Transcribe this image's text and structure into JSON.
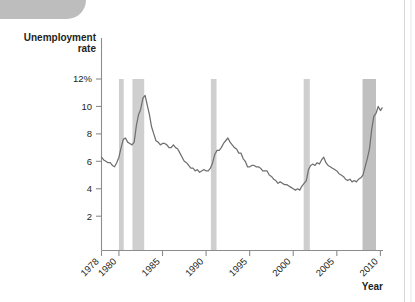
{
  "figure": {
    "y_axis_title_line1": "Unemployment",
    "y_axis_title_line2": "rate",
    "x_axis_title": "Year",
    "line_color": "#6f6f6f",
    "recession_band_color": "#cfcfcf",
    "recession_band_color_dark": "#c0c0c0",
    "axis_color": "#8c8c8c"
  },
  "chart_data": {
    "type": "line",
    "title": "",
    "xlabel": "Year",
    "ylabel": "Unemployment rate",
    "xlim": [
      1978,
      2010.3
    ],
    "ylim": [
      0,
      12
    ],
    "grid": false,
    "legend": "none",
    "ytick_labels": [
      "12%",
      "10",
      "8",
      "6",
      "4",
      "2"
    ],
    "ytick_values": [
      12,
      10,
      8,
      6,
      4,
      2
    ],
    "xtick_labels": [
      "1978",
      "1980",
      "1985",
      "1990",
      "1995",
      "2000",
      "2005",
      "2010"
    ],
    "xtick_values": [
      1978,
      1980,
      1985,
      1990,
      1995,
      2000,
      2005,
      2010
    ],
    "annotations": [
      {
        "label": "shaded bars mark recessions",
        "visible": false
      }
    ],
    "recessions": [
      {
        "start": 1980.0,
        "end": 1980.55
      },
      {
        "start": 1981.55,
        "end": 1982.9
      },
      {
        "start": 1990.55,
        "end": 1991.2
      },
      {
        "start": 2001.2,
        "end": 2001.9
      },
      {
        "start": 2007.95,
        "end": 2009.5
      }
    ],
    "series": [
      {
        "name": "Unemployment rate",
        "x": [
          1978.0,
          1978.25,
          1978.5,
          1978.75,
          1979.0,
          1979.25,
          1979.5,
          1979.75,
          1980.0,
          1980.25,
          1980.5,
          1980.75,
          1981.0,
          1981.25,
          1981.5,
          1981.75,
          1982.0,
          1982.25,
          1982.5,
          1982.75,
          1983.0,
          1983.25,
          1983.5,
          1983.75,
          1984.0,
          1984.25,
          1984.5,
          1984.75,
          1985.0,
          1985.25,
          1985.5,
          1985.75,
          1986.0,
          1986.25,
          1986.5,
          1986.75,
          1987.0,
          1987.25,
          1987.5,
          1987.75,
          1988.0,
          1988.25,
          1988.5,
          1988.75,
          1989.0,
          1989.25,
          1989.5,
          1989.75,
          1990.0,
          1990.25,
          1990.5,
          1990.75,
          1991.0,
          1991.25,
          1991.5,
          1991.75,
          1992.0,
          1992.25,
          1992.5,
          1992.75,
          1993.0,
          1993.25,
          1993.5,
          1993.75,
          1994.0,
          1994.25,
          1994.5,
          1994.75,
          1995.0,
          1995.25,
          1995.5,
          1995.75,
          1996.0,
          1996.25,
          1996.5,
          1996.75,
          1997.0,
          1997.25,
          1997.5,
          1997.75,
          1998.0,
          1998.25,
          1998.5,
          1998.75,
          1999.0,
          1999.25,
          1999.5,
          1999.75,
          2000.0,
          2000.25,
          2000.5,
          2000.75,
          2001.0,
          2001.25,
          2001.5,
          2001.75,
          2002.0,
          2002.25,
          2002.5,
          2002.75,
          2003.0,
          2003.25,
          2003.5,
          2003.75,
          2004.0,
          2004.25,
          2004.5,
          2004.75,
          2005.0,
          2005.25,
          2005.5,
          2005.75,
          2006.0,
          2006.25,
          2006.5,
          2006.75,
          2007.0,
          2007.25,
          2007.5,
          2007.75,
          2008.0,
          2008.25,
          2008.5,
          2008.75,
          2009.0,
          2009.25,
          2009.5,
          2009.75,
          2010.0,
          2010.2
        ],
        "values": [
          6.3,
          6.1,
          6.0,
          5.9,
          5.9,
          5.7,
          5.6,
          5.9,
          6.3,
          7.0,
          7.6,
          7.7,
          7.4,
          7.3,
          7.2,
          7.4,
          8.6,
          9.4,
          9.8,
          10.6,
          10.8,
          10.1,
          9.4,
          8.5,
          8.0,
          7.5,
          7.4,
          7.2,
          7.3,
          7.3,
          7.2,
          7.0,
          7.0,
          7.2,
          7.0,
          6.9,
          6.6,
          6.3,
          6.0,
          5.9,
          5.7,
          5.5,
          5.5,
          5.3,
          5.4,
          5.2,
          5.3,
          5.4,
          5.3,
          5.3,
          5.5,
          5.9,
          6.5,
          6.8,
          6.8,
          7.0,
          7.3,
          7.5,
          7.7,
          7.4,
          7.2,
          7.0,
          6.9,
          6.6,
          6.6,
          6.2,
          6.0,
          5.6,
          5.6,
          5.7,
          5.7,
          5.6,
          5.6,
          5.5,
          5.3,
          5.3,
          5.3,
          5.0,
          4.9,
          4.7,
          4.6,
          4.4,
          4.5,
          4.4,
          4.3,
          4.3,
          4.2,
          4.1,
          4.0,
          3.9,
          4.0,
          3.9,
          4.2,
          4.4,
          4.6,
          5.4,
          5.7,
          5.8,
          5.7,
          5.9,
          5.8,
          6.1,
          6.3,
          5.9,
          5.7,
          5.6,
          5.5,
          5.4,
          5.3,
          5.1,
          5.0,
          4.9,
          4.7,
          4.6,
          4.7,
          4.5,
          4.6,
          4.5,
          4.7,
          4.8,
          5.0,
          5.6,
          6.2,
          6.9,
          8.3,
          9.3,
          9.5,
          10.0,
          9.7,
          9.9
        ]
      }
    ]
  }
}
